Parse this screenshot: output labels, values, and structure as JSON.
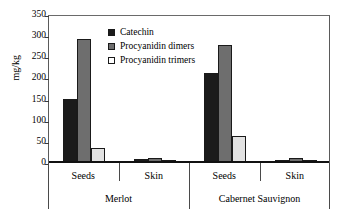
{
  "chart_data": {
    "type": "bar",
    "title": "",
    "xlabel": "",
    "ylabel": "mg/kg",
    "ylim": [
      0,
      350
    ],
    "yticks": [
      0,
      50,
      100,
      150,
      200,
      250,
      300,
      350
    ],
    "grid": false,
    "legend_position": "top-center",
    "categories": [
      "Seeds",
      "Skin",
      "Seeds",
      "Skin"
    ],
    "group_labels": [
      "Merlot",
      "Cabernet Sauvignon"
    ],
    "groups": [
      {
        "variety": "Merlot",
        "tissues": [
          {
            "name": "Seeds",
            "values": [
              148,
              291,
              33
            ]
          },
          {
            "name": "Skin",
            "values": [
              6,
              10,
              2
            ]
          }
        ]
      },
      {
        "variety": "Cabernet Sauvignon",
        "tissues": [
          {
            "name": "Seeds",
            "values": [
              210,
              277,
              62
            ]
          },
          {
            "name": "Skin",
            "values": [
              3,
              10,
              1
            ]
          }
        ]
      }
    ],
    "series": [
      {
        "name": "Catechin",
        "color": "#1b1b1b",
        "values": [
          148,
          6,
          210,
          3
        ]
      },
      {
        "name": "Procyanidin dimers",
        "color": "#6e6e6e",
        "values": [
          291,
          10,
          277,
          10
        ]
      },
      {
        "name": "Procyanidin trimers",
        "color": "#e2e2e2",
        "values": [
          33,
          2,
          62,
          1
        ]
      }
    ]
  },
  "legend": {
    "items": [
      {
        "label": "Catechin"
      },
      {
        "label": "Procyanidin dimers"
      },
      {
        "label": "Procyanidin trimers"
      }
    ]
  },
  "axis": {
    "y_label": "mg/kg",
    "y_ticks": [
      "0",
      "50",
      "100",
      "150",
      "200",
      "250",
      "300",
      "350"
    ]
  },
  "x_axis": {
    "tissue_labels": [
      "Seeds",
      "Skin",
      "Seeds",
      "Skin"
    ],
    "variety_labels": [
      "Merlot",
      "Cabernet Sauvignon"
    ]
  }
}
